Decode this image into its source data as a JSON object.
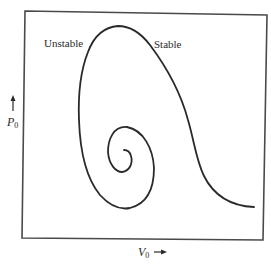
{
  "diagram": {
    "labels": {
      "unstable": "Unstable",
      "stable": "Stable"
    },
    "axes": {
      "y": {
        "symbol": "P",
        "subscript": "0",
        "arrow": "up-arrow"
      },
      "x": {
        "symbol": "V",
        "subscript": "0",
        "arrow": "right-arrow"
      }
    },
    "curve": {
      "description": "Spiral curve of P0 versus V0, winding inward from an unstable branch; stable branch descends to the right",
      "color": "#2a2a2a"
    },
    "frame_color": "#4a4a4a"
  }
}
